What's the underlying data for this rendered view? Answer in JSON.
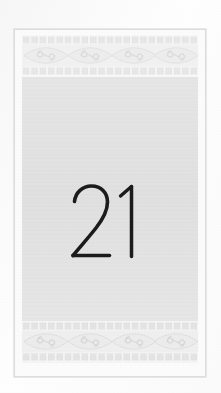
{
  "document": {
    "type": "scanned-book-page",
    "folio_number": "21",
    "folio_label": "21",
    "page_alt": "Scanned book page with ornamental borders and folio number 21"
  },
  "ornament": {
    "name": "greek-wave-eye-spiral-border",
    "description": "Repeating lens/eye medallions with inward double spirals, framed above and below by rows of square dentils",
    "top_band_label": "Top ornamental border",
    "bottom_band_label": "Bottom ornamental border",
    "dentil_count": 21,
    "medallion_count": 2
  },
  "colors": {
    "scan_background": "#fdfdfd",
    "page_sheet": "#fbfbfb",
    "page_edge": "#c6c6c6",
    "content_field": "#e4e4e4",
    "ornament_fill": "#e9e9e9",
    "ornament_line": "#dcdcdc",
    "folio_ink": "#1a1a1a"
  },
  "geometry": {
    "canvas_width": 221,
    "canvas_height": 393,
    "page_left": 14,
    "page_top": 29,
    "page_width": 192,
    "page_height": 348
  }
}
